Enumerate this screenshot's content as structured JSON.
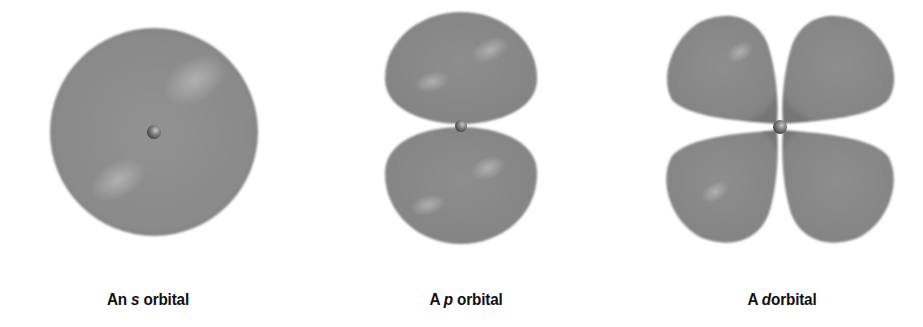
{
  "figure": {
    "colors": {
      "background": "#ffffff",
      "lobe_fill": "#8c8c8c",
      "lobe_highlight": "#b4b4b4",
      "lobe_shadow": "#6f6f6f",
      "nucleus": "#6a6a6a",
      "label": "#111111"
    },
    "orbitals": [
      {
        "type": "s",
        "label_prefix": "An ",
        "label_letter": "s",
        "label_suffix": " orbital",
        "center_x": 154,
        "center_y": 132,
        "shape": "sphere"
      },
      {
        "type": "p",
        "label_prefix": "A ",
        "label_letter": "p",
        "label_suffix": " orbital",
        "center_x": 461,
        "center_y": 125,
        "shape": "two-lobes-vertical"
      },
      {
        "type": "d",
        "label_prefix": "A ",
        "label_letter": "d",
        "label_suffix": "orbital",
        "center_x": 780,
        "center_y": 127,
        "shape": "four-lobes-cloverleaf"
      }
    ]
  }
}
